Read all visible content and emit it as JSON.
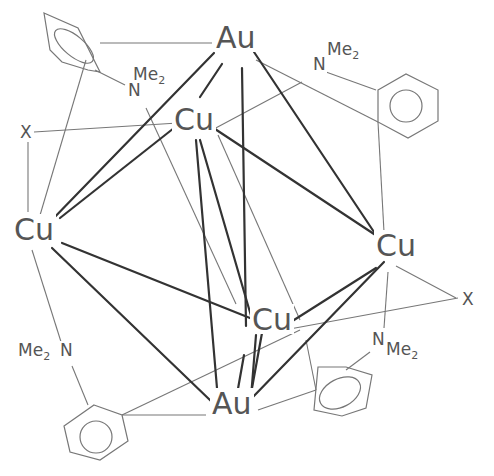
{
  "diagram": {
    "colors": {
      "thin": "#777777",
      "bold": "#333333",
      "text": "#555555",
      "background": "#ffffff"
    },
    "atoms": [
      {
        "id": "Au1",
        "label": "Au",
        "x": 216,
        "y": 48
      },
      {
        "id": "Cu1",
        "label": "Cu",
        "x": 174,
        "y": 130
      },
      {
        "id": "Cu2",
        "label": "Cu",
        "x": 14,
        "y": 240
      },
      {
        "id": "Cu3",
        "label": "Cu",
        "x": 376,
        "y": 256
      },
      {
        "id": "Cu4",
        "label": "Cu",
        "x": 252,
        "y": 330
      },
      {
        "id": "Au2",
        "label": "Au",
        "x": 212,
        "y": 414
      }
    ],
    "halides": [
      {
        "id": "X1",
        "label": "X",
        "x": 20,
        "y": 138
      },
      {
        "id": "X2",
        "label": "X",
        "x": 462,
        "y": 305
      }
    ],
    "amines": [
      {
        "id": "N1",
        "n": "N",
        "me": "Me",
        "sub2": "2",
        "nx": 128,
        "ny": 96,
        "mex": 133,
        "mey": 80
      },
      {
        "id": "N2",
        "n": "N",
        "me": "Me",
        "sub2": "2",
        "nx": 313,
        "ny": 70,
        "mex": 327,
        "mey": 55
      },
      {
        "id": "N3",
        "n": "N",
        "me": "Me",
        "sub2": "2",
        "nx": 372,
        "ny": 345,
        "mex": 386,
        "mey": 355
      },
      {
        "id": "N4",
        "n": "N",
        "me": "Me",
        "sub2": "2",
        "nx": 60,
        "ny": 356,
        "mex": 18,
        "mey": 356
      }
    ],
    "rings": [
      {
        "id": "ring-top-left",
        "points": "44,13 78,28 100,72 88,70 62,62 50,50",
        "inner": {
          "type": "ellipse",
          "cx": 74,
          "cy": 46,
          "rx": 24,
          "ry": 10,
          "rot": 40
        }
      },
      {
        "id": "ring-top-right",
        "points": "378,90 406,74 438,90 438,121 408,138 378,122",
        "inner": {
          "type": "circle",
          "cx": 406,
          "cy": 106,
          "r": 16
        }
      },
      {
        "id": "ring-bottom-left",
        "points": "94,405 122,415 128,441 100,460 70,452 64,426",
        "inner": {
          "type": "circle",
          "cx": 96,
          "cy": 437,
          "r": 16
        }
      },
      {
        "id": "ring-bottom-right",
        "points": "318,367 346,367 372,375 366,408 342,416 314,410",
        "inner": {
          "type": "ellipse",
          "cx": 340,
          "cy": 393,
          "rx": 22,
          "ry": 14,
          "rot": -28
        }
      }
    ],
    "bold_bonds": [
      [
        214,
        53,
        47,
        225
      ],
      [
        222,
        64,
        200,
        97
      ],
      [
        242,
        68,
        246,
        326
      ],
      [
        254,
        52,
        378,
        238
      ],
      [
        174,
        128,
        60,
        218
      ],
      [
        212,
        127,
        380,
        238
      ],
      [
        196,
        140,
        218,
        400
      ],
      [
        200,
        140,
        254,
        326
      ],
      [
        62,
        243,
        250,
        318
      ],
      [
        52,
        248,
        212,
        402
      ],
      [
        376,
        268,
        294,
        320
      ],
      [
        384,
        262,
        250,
        400
      ],
      [
        262,
        333,
        248,
        410
      ],
      [
        256,
        335,
        250,
        410
      ],
      [
        244,
        355,
        236,
        400
      ]
    ],
    "thin_bonds": [
      [
        100,
        43,
        212,
        43
      ],
      [
        95,
        70,
        125,
        85
      ],
      [
        86,
        60,
        38,
        222
      ],
      [
        34,
        132,
        194,
        122
      ],
      [
        146,
        108,
        236,
        304
      ],
      [
        212,
        130,
        302,
        82
      ],
      [
        256,
        60,
        378,
        122
      ],
      [
        326,
        72,
        376,
        90
      ],
      [
        378,
        122,
        384,
        232
      ],
      [
        28,
        138,
        28,
        212
      ],
      [
        32,
        250,
        62,
        345
      ],
      [
        72,
        366,
        88,
        405
      ],
      [
        122,
        415,
        300,
        330
      ],
      [
        122,
        415,
        206,
        415
      ],
      [
        268,
        333,
        458,
        298
      ],
      [
        396,
        266,
        456,
        298
      ],
      [
        388,
        272,
        384,
        328
      ],
      [
        370,
        352,
        346,
        370
      ],
      [
        306,
        340,
        316,
        390
      ],
      [
        258,
        410,
        316,
        390
      ],
      [
        218,
        135,
        300,
        320
      ]
    ]
  }
}
